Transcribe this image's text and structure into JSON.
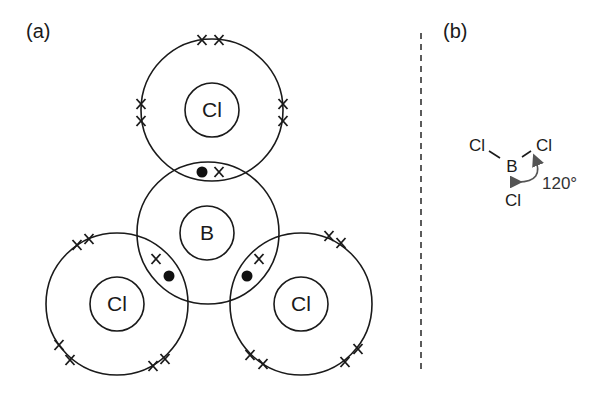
{
  "figure": {
    "panel_a": {
      "label": "(a)",
      "title": "Dot-and-cross diagram of BCl3",
      "atoms": {
        "top_cl": "Cl",
        "boron": "B",
        "left_cl": "Cl",
        "right_cl": "Cl"
      },
      "bond_electrons": {
        "boron_electron": "dot",
        "chlorine_electron": "x"
      }
    },
    "panel_b": {
      "label": "(b)",
      "title": "Trigonal planar shape of BCl3",
      "atoms": {
        "central": "B",
        "left": "Cl",
        "right": "Cl",
        "bottom": "Cl"
      },
      "bond_angle": "120°"
    },
    "divider": "dashed",
    "colors": {
      "line": "#1a1a1a",
      "arrow": "#555555",
      "background": "#ffffff"
    }
  }
}
